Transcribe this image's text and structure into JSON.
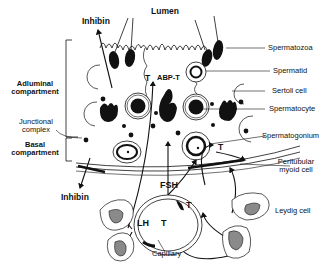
{
  "diagram": {
    "labels": {
      "lumen": "Lumen",
      "inhibin_top": "Inhibin",
      "inhibin_bottom": "Inhibin",
      "adluminal_line1": "Adluminal",
      "adluminal_line2": "compartment",
      "junctional_line1": "Junctional",
      "junctional_line2": "complex",
      "basal_line1": "Basal",
      "basal_line2": "compartment",
      "t_top": "T",
      "abp_t": "ABP-T",
      "t_right": "T",
      "fsh": "FSH",
      "lh": "LH",
      "t_capillary": "T",
      "t_leydig": "T",
      "capillary": "Capillary",
      "spermatozoa": "Spermatozoa",
      "spermatid": "Spermatid",
      "sertoli_cell": "Sertoli cell",
      "spermatocyte": "Spermatocyte",
      "spermatogonium": "Spermatogonium",
      "peritubular_line1": "Peritubular",
      "peritubular_line2": "myoid cell",
      "leydig_cell": "Leydig cell"
    },
    "colors": {
      "ink": "#111111",
      "nucleus_fill": "#8a8a8a",
      "background": "#ffffff"
    }
  }
}
